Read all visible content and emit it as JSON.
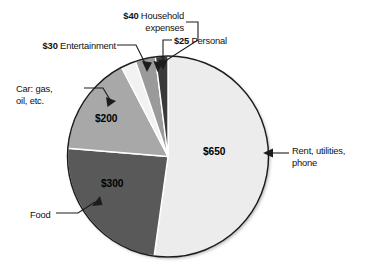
{
  "chart_data": {
    "type": "pie",
    "title": "",
    "currency": "$",
    "total": 1245,
    "start_angle_deg": 0,
    "direction": "clockwise",
    "legend": "none",
    "categories": [
      "Rent, utilities, phone",
      "Food",
      "Car: gas, oil, etc.",
      "Entertainment",
      "Household expenses",
      "Personal"
    ],
    "values": [
      650,
      300,
      200,
      30,
      40,
      25
    ],
    "labels": [
      "$650",
      "$300",
      "$200",
      "$30",
      "$40",
      "$25"
    ],
    "colors": [
      "#ececec",
      "#595959",
      "#a8a8a8",
      "#f2f2f2",
      "#9a9a9a",
      "#3a3a3a"
    ],
    "slices": [
      {
        "name": "rent",
        "label": "$650",
        "value": 650,
        "category_line1": "Rent, utilities,",
        "category_line2": "phone",
        "color": "#ececec",
        "start_deg": 0,
        "sweep_deg": 187.95
      },
      {
        "name": "food",
        "label": "$300",
        "value": 300,
        "category_line1": "Food",
        "category_line2": "",
        "color": "#595959",
        "start_deg": 187.95,
        "sweep_deg": 86.75
      },
      {
        "name": "car",
        "label": "$200",
        "value": 200,
        "category_line1": "Car: gas,",
        "category_line2": "oil, etc.",
        "color": "#a8a8a8",
        "start_deg": 274.7,
        "sweep_deg": 57.83
      },
      {
        "name": "entertainment",
        "label": "$30",
        "value": 30,
        "category_line1": "Entertainment",
        "category_line2": "",
        "color": "#f2f2f2",
        "start_deg": 332.53,
        "sweep_deg": 8.67
      },
      {
        "name": "household",
        "label": "$40",
        "value": 40,
        "category_line1": "Household",
        "category_line2": "expenses",
        "color": "#9a9a9a",
        "start_deg": 341.2,
        "sweep_deg": 11.57
      },
      {
        "name": "personal",
        "label": "$25",
        "value": 25,
        "category_line1": "Personal",
        "category_line2": "",
        "color": "#3a3a3a",
        "start_deg": 352.77,
        "sweep_deg": 7.23
      }
    ]
  },
  "callouts": {
    "household": {
      "amount": "$40",
      "text": "Household",
      "text2": "expenses"
    },
    "entertainment": {
      "amount": "$30",
      "text": "Entertainment"
    },
    "personal": {
      "amount": "$25",
      "text": "Personal"
    },
    "car": {
      "line1": "Car: gas,",
      "line2": "oil, etc."
    },
    "rent": {
      "line1": "Rent, utilities,",
      "line2": "phone"
    },
    "food": {
      "line1": "Food"
    }
  },
  "values_in_pie": {
    "rent": "$650",
    "food": "$300",
    "car": "$200"
  },
  "style": {
    "outline_color": "#1c1c1c",
    "separator_color": "#ffffff",
    "background": "#ffffff",
    "leader_color": "#1c1c1c"
  }
}
